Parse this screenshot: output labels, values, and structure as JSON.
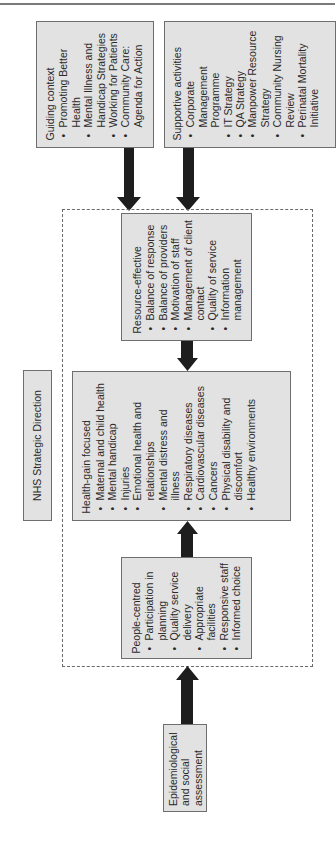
{
  "diagram": {
    "title": "NHS Strategic Direction",
    "boxes": {
      "guiding_context": {
        "heading": "Guiding context",
        "items": [
          "Promoting Better Health",
          "Mental Illness and Handicap Strategies",
          "Working for Patients",
          "Community Care: Agenda for Action"
        ]
      },
      "supportive_activities": {
        "heading": "Supportive activities",
        "items": [
          "Corporate Management Programme",
          "IT Strategy",
          "QA Strategy",
          "Manpower Resource Strategy",
          "Community Nursing Review",
          "Perinatal Mortality Initiative"
        ]
      },
      "resource_effective": {
        "heading": "Resource-effective",
        "items": [
          "Balance of response",
          "Balance of providers",
          "Motivation of staff",
          "Management of client contact",
          "Quality of service",
          "Information management"
        ]
      },
      "health_gain_focused": {
        "heading": "Health-gain focused",
        "items": [
          "Maternal and child health",
          "Mental handicap",
          "Injuries",
          "Emotional health and relationships",
          "Mental distress and illness",
          "Respiratory diseases",
          "Cardiovascular diseases",
          "Cancers",
          "Physical disability and discomfort",
          "Healthy environments"
        ]
      },
      "people_centred": {
        "heading": "People-centred",
        "items": [
          "Participation in planning",
          "Quality service delivery",
          "Appropriate facilities",
          "Responsive staff",
          "Informed choice"
        ]
      },
      "epidemiological": {
        "heading": "Epidemiological and social assessment"
      }
    },
    "bullet_glyph": "•",
    "colors": {
      "box_fill": "#e2e2e2",
      "box_border": "#6e6e6e",
      "arrow": "#1e1e1e",
      "dashed_frame": "#6a6a6a"
    },
    "orientation": "rotated 90° counter-clockwise"
  }
}
